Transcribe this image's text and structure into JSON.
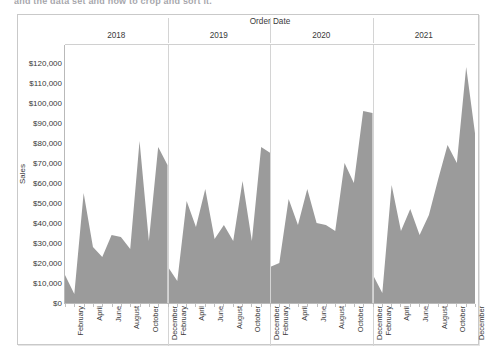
{
  "top_fragment": "and the data set and how to crop and sort it.",
  "header": {
    "column_title": "Order Date"
  },
  "axes": {
    "y_title": "Sales",
    "y_ticks": [
      "$120,000",
      "$110,000",
      "$100,000",
      "$90,000",
      "$80,000",
      "$70,000",
      "$60,000",
      "$50,000",
      "$40,000",
      "$30,000",
      "$20,000",
      "$10,000",
      "$0"
    ],
    "x_month_labels": [
      "February",
      "April",
      "June",
      "August",
      "October",
      "December"
    ]
  },
  "colors": {
    "area_fill": "#9b9b9b",
    "grid_line": "#d4d4d4",
    "axis_line": "#b9b9b9",
    "card_border": "#c9c9c9",
    "text": "#3a3a3a"
  },
  "chart_data": {
    "type": "area",
    "title": "Order Date",
    "xlabel": "Order Date",
    "ylabel": "Sales",
    "ylim": [
      0,
      120000
    ],
    "ytick_step": 10000,
    "grid": false,
    "legend_position": "none",
    "panel_variable": "Year",
    "panels": [
      "2018",
      "2019",
      "2020",
      "2021"
    ],
    "categories": [
      "January",
      "February",
      "March",
      "April",
      "May",
      "June",
      "July",
      "August",
      "September",
      "October",
      "November",
      "December"
    ],
    "visible_xtick_labels": [
      "February",
      "April",
      "June",
      "August",
      "October",
      "December"
    ],
    "series": [
      {
        "name": "2018",
        "panel": "2018",
        "values": [
          14000,
          4500,
          55000,
          28000,
          23000,
          34000,
          33000,
          27000,
          81000,
          31000,
          78000,
          69000
        ]
      },
      {
        "name": "2019",
        "panel": "2019",
        "values": [
          18000,
          11000,
          51000,
          38000,
          57000,
          32000,
          39000,
          31000,
          61000,
          31000,
          78000,
          75000
        ]
      },
      {
        "name": "2020",
        "panel": "2020",
        "values": [
          18000,
          20000,
          52000,
          39000,
          57000,
          40000,
          39000,
          36000,
          70000,
          60000,
          96000,
          95000
        ]
      },
      {
        "name": "2021",
        "panel": "2021",
        "values": [
          14000,
          5000,
          59000,
          36000,
          47000,
          34000,
          44000,
          62000,
          79000,
          70000,
          118000,
          83000
        ]
      }
    ]
  }
}
